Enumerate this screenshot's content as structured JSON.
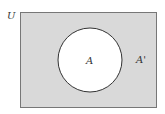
{
  "diagram": {
    "type": "venn",
    "universe_label": "U",
    "set_label": "A",
    "complement_label": "A'",
    "colors": {
      "universe_fill": "#d9d9d9",
      "universe_stroke": "#777777",
      "set_fill": "#ffffff",
      "set_stroke": "#333333",
      "text": "#333333"
    }
  }
}
